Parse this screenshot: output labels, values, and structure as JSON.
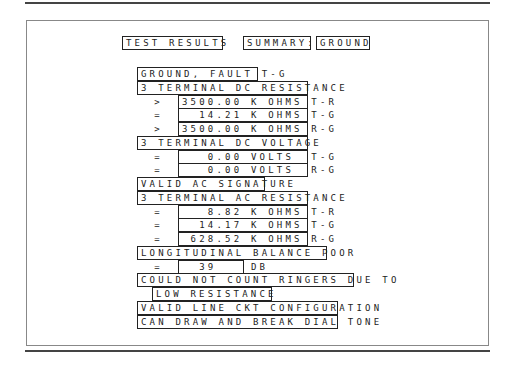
{
  "header": {
    "title": "TEST RESULTS",
    "summary_label": "SUMMARY:",
    "summary_value": "GROUND"
  },
  "rows": [
    {
      "type": "heading",
      "text": "GROUND, FAULT T-G"
    },
    {
      "type": "heading",
      "text": "3 TERMINAL DC RESISTANCE"
    },
    {
      "type": "value",
      "sym": ">",
      "text": "3500.00 K OHMS T-R"
    },
    {
      "type": "value",
      "sym": "=",
      "text": "  14.21 K OHMS T-G"
    },
    {
      "type": "value",
      "sym": ">",
      "text": "3500.00 K OHMS R-G"
    },
    {
      "type": "heading",
      "text": "3 TERMINAL DC VOLTAGE"
    },
    {
      "type": "value",
      "sym": "=",
      "text": "   0.00 VOLTS  T-G"
    },
    {
      "type": "value",
      "sym": "=",
      "text": "   0.00 VOLTS  R-G"
    },
    {
      "type": "heading",
      "text": "VALID AC SIGNATURE"
    },
    {
      "type": "heading",
      "text": "3 TERMINAL AC RESISTANCE"
    },
    {
      "type": "value",
      "sym": "=",
      "text": "   8.82 K OHMS T-R"
    },
    {
      "type": "value",
      "sym": "=",
      "text": "  14.17 K OHMS T-G"
    },
    {
      "type": "value",
      "sym": "=",
      "text": " 628.52 K OHMS R-G"
    },
    {
      "type": "heading",
      "text": "LONGITUDINAL BALANCE POOR"
    },
    {
      "type": "value",
      "sym": "=",
      "text": "  39    DB"
    },
    {
      "type": "heading",
      "text": "COULD NOT COUNT RINGERS DUE TO"
    },
    {
      "type": "indent",
      "text": "LOW RESISTANCE"
    },
    {
      "type": "heading",
      "text": "VALID LINE CKT CONFIGURATION"
    },
    {
      "type": "heading",
      "text": "CAN DRAW AND BREAK DIAL TONE"
    }
  ]
}
